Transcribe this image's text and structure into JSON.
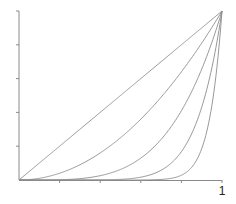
{
  "chart_data": {
    "type": "line",
    "title": "",
    "xlabel": "",
    "ylabel": "",
    "xlim": [
      0,
      1
    ],
    "ylim": [
      0,
      1
    ],
    "grid": false,
    "legend": null,
    "x_ticks": [
      0,
      0.2,
      0.4,
      0.6,
      0.8,
      1
    ],
    "y_ticks": [
      0,
      0.2,
      0.4,
      0.6,
      0.8,
      1
    ],
    "x_tick_labels": [
      "",
      "",
      "",
      "",
      "",
      "1"
    ],
    "y_tick_labels": [
      "",
      "",
      "",
      "",
      "",
      ""
    ],
    "series": [
      {
        "name": "y = x",
        "exponent": 1,
        "x": [
          0,
          0.2,
          0.4,
          0.6,
          0.8,
          1
        ],
        "values": [
          0,
          0.2,
          0.4,
          0.6,
          0.8,
          1
        ]
      },
      {
        "name": "y = x^2",
        "exponent": 2,
        "x": [
          0,
          0.2,
          0.4,
          0.6,
          0.8,
          1
        ],
        "values": [
          0,
          0.04,
          0.16,
          0.36,
          0.64,
          1
        ]
      },
      {
        "name": "y = x^4",
        "exponent": 4,
        "x": [
          0,
          0.2,
          0.4,
          0.6,
          0.8,
          1
        ],
        "values": [
          0,
          0.0016,
          0.0256,
          0.1296,
          0.4096,
          1
        ]
      },
      {
        "name": "y = x^8",
        "exponent": 8,
        "x": [
          0,
          0.2,
          0.4,
          0.6,
          0.8,
          1
        ],
        "values": [
          0,
          0.0,
          0.0007,
          0.0168,
          0.1678,
          1
        ]
      },
      {
        "name": "y = x^16",
        "exponent": 16,
        "x": [
          0,
          0.2,
          0.4,
          0.6,
          0.8,
          1
        ],
        "values": [
          0,
          0.0,
          0.0,
          0.0003,
          0.0281,
          1
        ]
      }
    ]
  },
  "axes": {
    "x_end_label": "1"
  },
  "colors": {
    "axis": "#8a8a8a",
    "curve": "#8c8c8c",
    "label": "#222222",
    "background": "#ffffff"
  }
}
